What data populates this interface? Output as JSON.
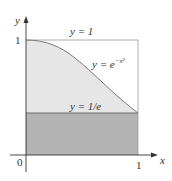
{
  "figure": {
    "type": "diagram",
    "axes": {
      "x_label": "x",
      "y_label": "y",
      "origin_label": "0",
      "x_tick_label": "1",
      "y_tick_label": "1"
    },
    "curves": [
      {
        "name": "upper-bound",
        "label": "y = 1"
      },
      {
        "name": "gaussian",
        "label_base": "y = e",
        "label_exp": "−x²"
      },
      {
        "name": "lower-bound",
        "label": "y = 1/e"
      }
    ],
    "colors": {
      "light_region": "#e6e6e6",
      "dark_region": "#b3b3b3",
      "curve": "#7a7a7a",
      "axis": "#333333",
      "box": "#999999"
    }
  }
}
